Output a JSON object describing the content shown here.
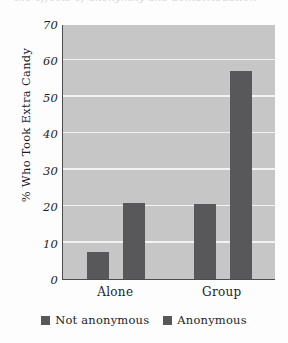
{
  "caption": {
    "cropped_top_text": "the effects of anonymity and deindividuation"
  },
  "chart_data": {
    "type": "bar",
    "title": "",
    "xlabel": "",
    "ylabel": "% Who Took Extra Candy",
    "categories": [
      "Alone",
      "Group"
    ],
    "series": [
      {
        "name": "Not anonymous",
        "values": [
          7.5,
          20.5
        ],
        "color": "#58585a"
      },
      {
        "name": "Anonymous",
        "values": [
          21,
          57
        ],
        "color": "#58585a"
      }
    ],
    "ylim": [
      0,
      70
    ],
    "yticks": [
      70,
      60,
      50,
      40,
      30,
      20,
      10,
      0
    ],
    "ytick_labels": [
      "70",
      "60",
      "50",
      "40",
      "30",
      "20",
      "10",
      "0"
    ],
    "grid": true,
    "grid_color": "#f2f2f2",
    "plot_background": "#c6c6c6",
    "axis_color": "#4c4c4e",
    "legend_position": "bottom-center"
  },
  "legend": {
    "items": [
      {
        "label": "Not anonymous"
      },
      {
        "label": "Anonymous"
      }
    ]
  }
}
